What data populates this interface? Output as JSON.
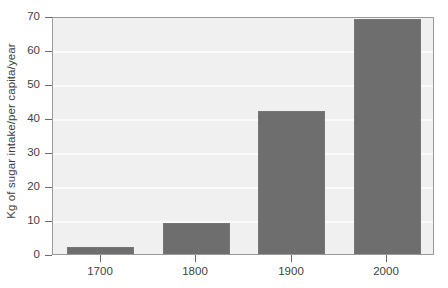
{
  "chart_data": {
    "type": "bar",
    "title": "",
    "subtitle": "",
    "xlabel": "",
    "ylabel": "Kg of sugar intake/per capita/year",
    "categories": [
      "1700",
      "1800",
      "1900",
      "2000"
    ],
    "values": [
      2,
      9,
      42,
      69
    ],
    "series": [
      {
        "name": "Sugar intake",
        "values": [
          2,
          9,
          42,
          69
        ]
      }
    ],
    "ylim": [
      0,
      70
    ],
    "xlim_categorical": true,
    "y_ticks": [
      0,
      10,
      20,
      30,
      40,
      50,
      60,
      70
    ],
    "y_tick_labels": [
      "0",
      "10",
      "20",
      "30",
      "40",
      "50",
      "60",
      "70"
    ],
    "x_tick_labels": [
      "1700",
      "1800",
      "1900",
      "2000"
    ],
    "grid": "horizontal",
    "legend": "none",
    "annotations": [],
    "colors": {
      "bar_fill": "#6e6e6e",
      "bar_edge": "#767676",
      "plot_background": "#f0f0f0",
      "plot_border": "#9a9a9a",
      "gridline": "#fbfbfb",
      "axis_text": "#3f3f3f",
      "tick_mark": "#6a6a6a",
      "figure_background": "#ffffff"
    }
  }
}
